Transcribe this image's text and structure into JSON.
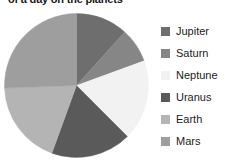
{
  "chart_data": {
    "type": "pie",
    "title": "of a day on the planets",
    "xlabel": "",
    "ylabel": "",
    "legend_position": "right",
    "grid": false,
    "categories": [
      "Jupiter",
      "Saturn",
      "Neptune",
      "Uranus",
      "Earth",
      "Mars"
    ],
    "values": [
      11.7,
      7.8,
      18.1,
      18.1,
      18.9,
      25.4
    ],
    "units": "percent",
    "angles_deg": [
      42,
      28,
      65,
      65,
      68,
      92
    ],
    "colors": [
      "#6e6e6e",
      "#868686",
      "#f2f2f2",
      "#5a5a5a",
      "#b4b4b4",
      "#9e9e9e"
    ],
    "slices": [
      {
        "label": "Jupiter",
        "value": 11.7,
        "start_deg": 0,
        "end_deg": 42,
        "color": "#6e6e6e"
      },
      {
        "label": "Saturn",
        "value": 7.8,
        "start_deg": 42,
        "end_deg": 70,
        "color": "#868686"
      },
      {
        "label": "Neptune",
        "value": 18.1,
        "start_deg": 70,
        "end_deg": 135,
        "color": "#f2f2f2"
      },
      {
        "label": "Uranus",
        "value": 18.1,
        "start_deg": 135,
        "end_deg": 200,
        "color": "#5a5a5a"
      },
      {
        "label": "Earth",
        "value": 18.9,
        "start_deg": 200,
        "end_deg": 268,
        "color": "#b4b4b4"
      },
      {
        "label": "Mars",
        "value": 25.4,
        "start_deg": 268,
        "end_deg": 360,
        "color": "#9e9e9e"
      }
    ]
  },
  "legend": {
    "items": [
      {
        "label": "Jupiter",
        "color": "#6e6e6e"
      },
      {
        "label": "Saturn",
        "color": "#868686"
      },
      {
        "label": "Neptune",
        "color": "#f2f2f2"
      },
      {
        "label": "Uranus",
        "color": "#5a5a5a"
      },
      {
        "label": "Earth",
        "color": "#b4b4b4"
      },
      {
        "label": "Mars",
        "color": "#9e9e9e"
      }
    ]
  }
}
